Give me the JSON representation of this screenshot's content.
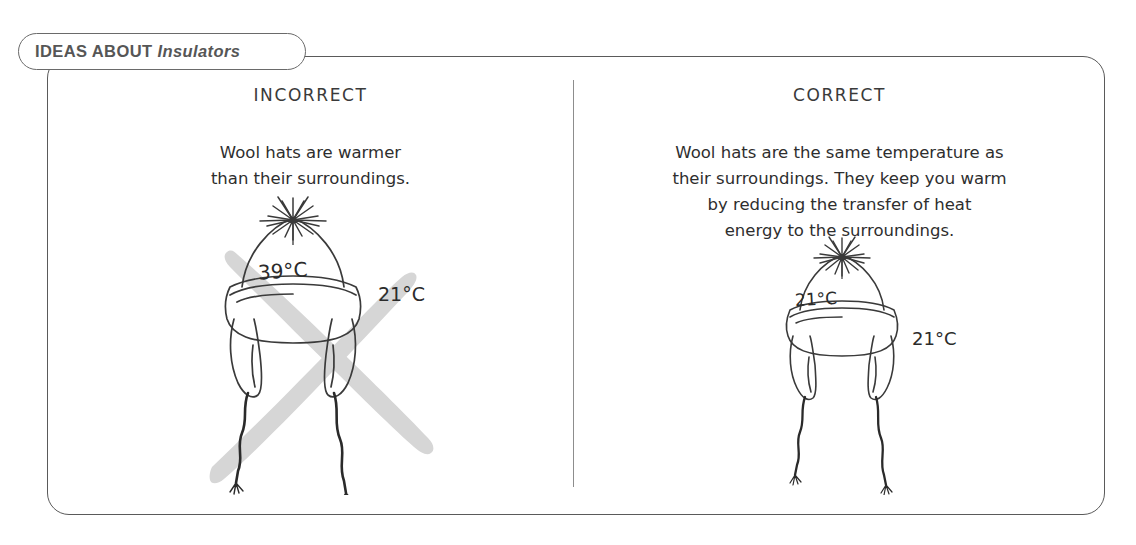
{
  "header": {
    "tab_label_main": "IDEAS ABOUT",
    "tab_label_italic": "Insulators",
    "tab_full": "IDEAS ABOUT Insulators"
  },
  "colors": {
    "frame_stroke": "#5a5a5a",
    "tab_stroke": "#6a6a6a",
    "tab_text": "#565656",
    "body_text": "#2e2e2e",
    "divider": "#8d8d8d",
    "cross_out_mark": "#d5d5d5",
    "ink": "#3a3a3a",
    "background": "#ffffff"
  },
  "columns": [
    {
      "id": "incorrect",
      "heading": "INCORRECT",
      "body_lines": [
        "Wool hats are warmer",
        "than their surroundings."
      ],
      "illustration": {
        "name": "wool-hat-sketch",
        "crossed_out": true,
        "hat_temperature": "39°C",
        "ambient_temperature": "21°C"
      }
    },
    {
      "id": "correct",
      "heading": "CORRECT",
      "body_lines": [
        "Wool hats are the same temperature as",
        "their surroundings. They keep you warm",
        "by reducing the transfer of heat",
        "energy to the surroundings."
      ],
      "illustration": {
        "name": "wool-hat-sketch",
        "crossed_out": false,
        "hat_temperature": "21°C",
        "ambient_temperature": "21°C"
      }
    }
  ]
}
